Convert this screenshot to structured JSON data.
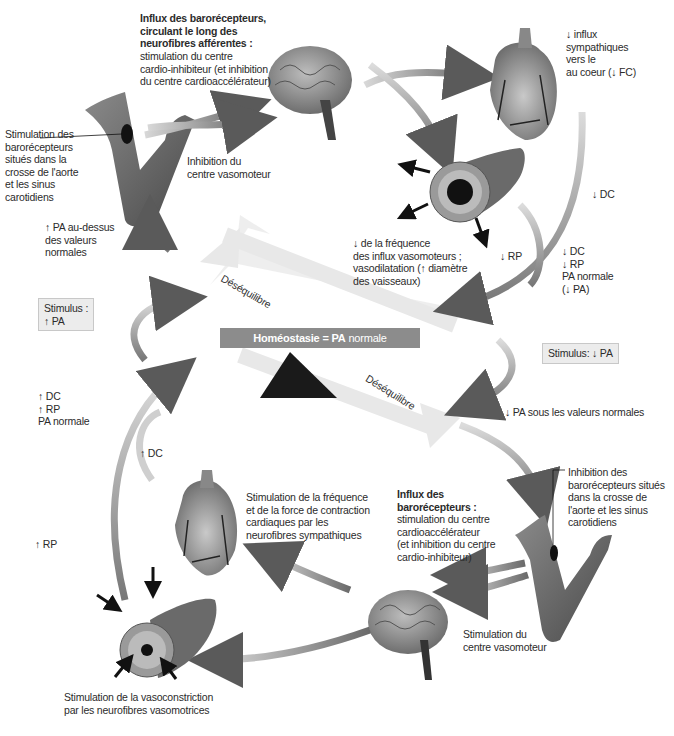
{
  "center": {
    "homeostasis_bold": "Homéostasie = PA",
    "homeostasis_rest": " normale",
    "imbalance_upper": "Déséquilibre",
    "imbalance_lower": "Déséquilibre"
  },
  "stimuli": {
    "up": {
      "line1": "Stimulus :",
      "line2": "↑ PA"
    },
    "down": {
      "line1": "Stimulus: ↓ PA"
    }
  },
  "upper_loop": {
    "baroreceptor_label": [
      "Stimulation des",
      "barorécepteurs",
      "situés dans la",
      "crosse de l'aorte",
      "et les sinus",
      "carotidiens"
    ],
    "pa_above": [
      "↑ PA au-dessus",
      "des valeurs",
      "normales"
    ],
    "afferent_bold": [
      "Influx des barorécepteurs,",
      "circulant le long des",
      "neurofibres afférentes :"
    ],
    "afferent_text": [
      "stimulation du centre",
      "cardio-inhibiteur (et inhibition",
      "du centre cardioaccélérateur)"
    ],
    "vasomotor_inhibition": [
      "Inhibition du",
      "centre vasomoteur"
    ],
    "sympathetic_down": [
      "↓ influx",
      "sympathiques",
      "vers le",
      "au coeur (↓ FC)"
    ],
    "dc_down": "↓ DC",
    "rp_down": "↓ RP",
    "vasodilation": [
      "↓ de la fréquence",
      "des influx vasomoteurs ;",
      "vasodilatation (↑ diamètre",
      "des vaisseaux)"
    ],
    "result": [
      "↓ DC",
      "↓ RP",
      "PA normale",
      "(↓ PA)"
    ]
  },
  "lower_loop": {
    "pa_below": "↓ PA sous les valeurs normales",
    "baroreceptor_inhibition": [
      "Inhibition des",
      "barorécepteurs situés",
      "dans la crosse de",
      "l'aorte et les sinus",
      "carotidiens"
    ],
    "afferent_bold": [
      "Influx des",
      "barorécepteurs :"
    ],
    "afferent_text": [
      "stimulation du centre",
      "cardioaccélérateur",
      "(et inhibition du centre",
      "cardio-inhibiteur)"
    ],
    "vasomotor_stimulation": [
      "Stimulation du",
      "centre vasomoteur"
    ],
    "cardiac_stimulation": [
      "Stimulation de la fréquence",
      "et de la force de contraction",
      "cardiaques par les",
      "neurofibres sympathiques"
    ],
    "vasoconstriction": [
      "Stimulation de la vasoconstriction",
      "par les neurofibres vasomotrices"
    ],
    "dc_up": "↑ DC",
    "rp_up": "↑ RP",
    "result": [
      "↑ DC",
      "↑ RP",
      "PA normale"
    ]
  }
}
